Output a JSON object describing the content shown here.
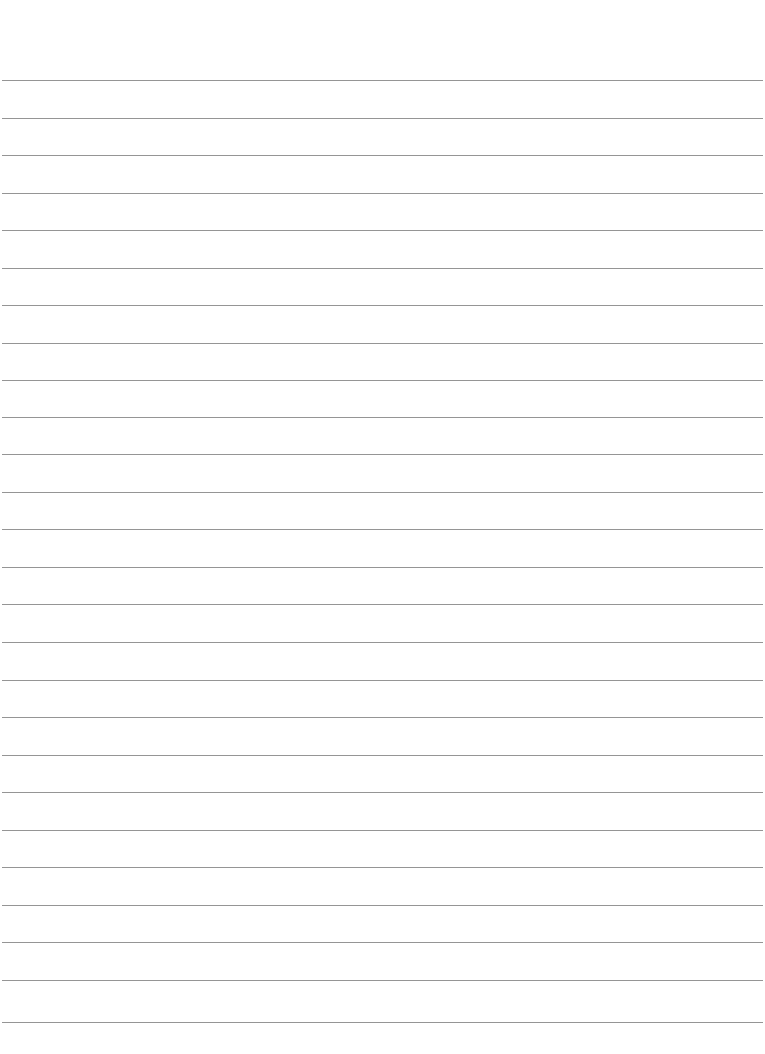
{
  "page": {
    "type": "lined-paper",
    "background_color": "#ffffff",
    "line_color": "#8a8a8a",
    "line_count": 26,
    "lines_y": [
      80,
      118,
      155,
      193,
      230,
      268,
      305,
      343,
      380,
      417,
      454,
      492,
      529,
      567,
      604,
      642,
      680,
      717,
      755,
      792,
      830,
      867,
      905,
      942,
      980,
      1022
    ],
    "text": []
  }
}
